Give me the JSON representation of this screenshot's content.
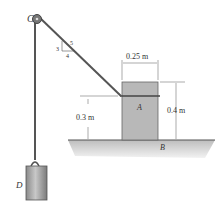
{
  "diagram": {
    "labels": {
      "pulley": "C",
      "block_a": "A",
      "ground_point": "B",
      "hanging_block": "D"
    },
    "slope": {
      "rise": "3",
      "run": "4",
      "hyp": "5"
    },
    "dimensions": {
      "block_width": "0.25 m",
      "block_height": "0.4 m",
      "rope_height": "0.3 m"
    },
    "colors": {
      "rope": "#555555",
      "block": "#b5b5b5",
      "ground": "#cfcfcf",
      "text": "#333333"
    }
  }
}
